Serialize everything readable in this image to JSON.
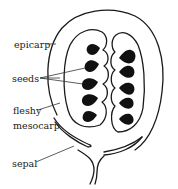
{
  "diagram": {
    "labels": {
      "epicarp": "epicarp",
      "seeds": "seeds",
      "fleshy": "fleshy",
      "mesocarp": "mesocarp",
      "sepal": "sepal"
    },
    "colors": {
      "line": "#1a1a1a",
      "seed": "#111111",
      "background": "#ffffff"
    },
    "seed_count": 10
  }
}
